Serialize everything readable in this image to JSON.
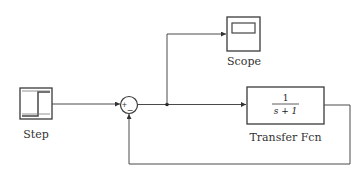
{
  "diagram": {
    "type": "simulink-block-diagram",
    "blocks": [
      {
        "id": "step",
        "label": "Step",
        "kind": "step-source"
      },
      {
        "id": "sum",
        "label": "",
        "kind": "sum",
        "signs": [
          "+",
          "−"
        ]
      },
      {
        "id": "scope",
        "label": "Scope",
        "kind": "scope-sink"
      },
      {
        "id": "tf",
        "label": "Transfer Fcn",
        "kind": "transfer-function",
        "numerator": "1",
        "denominator": "s+1"
      }
    ],
    "connections": [
      {
        "from": "step",
        "to": "sum",
        "port": "+"
      },
      {
        "from": "sum",
        "to": "tf"
      },
      {
        "from": "sum",
        "to": "scope",
        "via": "branch-point"
      },
      {
        "from": "tf",
        "to": "sum",
        "port": "−",
        "kind": "feedback"
      }
    ]
  },
  "labels": {
    "step": "Step",
    "scope": "Scope",
    "tf": "Transfer Fcn",
    "tf_num": "1",
    "tf_den": "s + 1",
    "sum_plus": "+",
    "sum_minus": "−"
  },
  "colors": {
    "line": "#4a4a4a",
    "block_border": "#3a3a3a",
    "background": "#ffffff"
  }
}
